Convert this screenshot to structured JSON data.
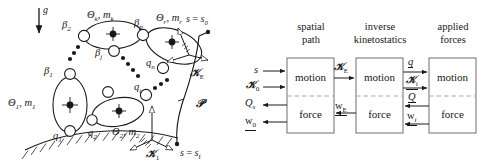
{
  "figure": {
    "type": "technical-diagram"
  },
  "mechanism": {
    "gravity_label": "g",
    "ground_label": "",
    "bodies": [
      {
        "id": "body1",
        "label_theta": "Θ",
        "label_sub": "1",
        "label_mass": "m",
        "label_mass_sub": "1",
        "full": "Θ1, m1"
      },
      {
        "id": "body2",
        "label_theta": "Θ",
        "label_sub": "2",
        "label_mass": "m",
        "label_mass_sub": "2",
        "full": "Θ2, m2"
      },
      {
        "id": "bodyk",
        "label_theta": "Θ",
        "label_sub": "k",
        "label_mass": "m",
        "label_mass_sub": "k",
        "full": "Θk, mk"
      },
      {
        "id": "bodyr",
        "label_theta": "Θ",
        "label_sub": "r",
        "label_mass": "m",
        "label_mass_sub": "r",
        "full": "Θr, mr"
      }
    ],
    "joint_labels_q": [
      "q1",
      "q2",
      "qi",
      "qn"
    ],
    "joint_labels_beta": [
      "β1",
      "β2",
      "βj",
      "βp"
    ],
    "frames": [
      {
        "name": "K1",
        "display": "ℬ₁",
        "letter": "K",
        "sub": "1"
      },
      {
        "name": "KE",
        "display": "ℬE",
        "letter": "K",
        "sub": "E"
      }
    ],
    "path": {
      "curve_label": "P",
      "start_label": "s = s",
      "start_sub": "0",
      "end_label": "s = s",
      "end_sub": "f"
    }
  },
  "blockdiagram": {
    "columns": [
      {
        "id": "col-spatial-path",
        "header_line1": "spatial",
        "header_line2": "path",
        "upper_cell": "motion",
        "lower_cell": "force"
      },
      {
        "id": "col-inverse-kinetostatics",
        "header_line1": "inverse",
        "header_line2": "kinetostatics",
        "upper_cell": "motion",
        "lower_cell": "force"
      },
      {
        "id": "col-applied-forces",
        "header_line1": "applied",
        "header_line2": "forces",
        "upper_cell": "motion",
        "lower_cell": "force"
      }
    ],
    "signals": {
      "input_s": {
        "base": "s",
        "sub": ""
      },
      "input_K0": {
        "base": "K",
        "sub": "0"
      },
      "output_Qs": {
        "base": "Q",
        "sub": "s"
      },
      "output_w0": {
        "base": "w",
        "sub": "0"
      },
      "sig_KE": {
        "base": "K",
        "sub": "E"
      },
      "sig_wE": {
        "base": "w",
        "sub": "E"
      },
      "sig_q": {
        "base": "q",
        "sub": ""
      },
      "sig_Ki": {
        "base": "K",
        "sub": "i"
      },
      "sig_Q": {
        "base": "Q",
        "sub": ""
      },
      "sig_wi": {
        "base": "w",
        "sub": "i"
      }
    }
  },
  "colors": {
    "stroke": "#1a1a1a",
    "dashed": "#b3a79a",
    "background": "#ffffff"
  }
}
